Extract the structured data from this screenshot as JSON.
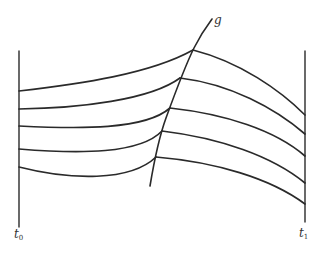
{
  "diagram": {
    "labels": {
      "left_boundary": "t",
      "left_boundary_subscript": "0",
      "right_boundary": "t",
      "right_boundary_subscript": "1",
      "curve": "g"
    },
    "colors": {
      "stroke": "#2a2a2a",
      "background": "#ffffff"
    },
    "boundaries": [
      {
        "name": "t0",
        "x": 19,
        "y_top": 51,
        "y_bottom": 227
      },
      {
        "name": "t1",
        "x": 305,
        "y_top": 51,
        "y_bottom": 222
      }
    ],
    "curve_g": {
      "points": [
        [
          150,
          186
        ],
        [
          156,
          157
        ],
        [
          162,
          131
        ],
        [
          170,
          108
        ],
        [
          180,
          78
        ],
        [
          193,
          50
        ],
        [
          212,
          19
        ]
      ]
    },
    "paths": [
      {
        "left": [
          19,
          91
        ],
        "junction": [
          193,
          50
        ],
        "right": [
          305,
          115
        ]
      },
      {
        "left": [
          19,
          109
        ],
        "junction": [
          180,
          78
        ],
        "right": [
          305,
          134
        ]
      },
      {
        "left": [
          19,
          126
        ],
        "junction": [
          170,
          108
        ],
        "right": [
          305,
          156
        ]
      },
      {
        "left": [
          19,
          149
        ],
        "junction": [
          162,
          131
        ],
        "right": [
          305,
          183
        ]
      },
      {
        "left": [
          19,
          167
        ],
        "junction": [
          156,
          157
        ],
        "right": [
          305,
          204
        ]
      }
    ]
  }
}
